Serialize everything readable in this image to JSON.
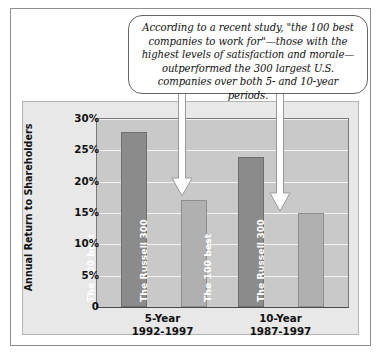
{
  "callout": {
    "text": "According to a recent study, \"the 100 best companies to work for\"—those with the highest levels of satisfaction and morale—outperformed the 300 largest U.S. companies over both 5- and 10-year periods."
  },
  "chart_data": {
    "type": "bar",
    "title": "",
    "xlabel": "",
    "ylabel": "Annual Return to Shareholders",
    "ylim": [
      0,
      30
    ],
    "ytick_labels": [
      "30%",
      "25%",
      "20%",
      "15%",
      "10%",
      "5%",
      "0"
    ],
    "ytick_values": [
      30,
      25,
      20,
      15,
      10,
      5,
      0
    ],
    "grid": true,
    "legend_position": "none",
    "categories": [
      "5-Year 1992-1997",
      "10-Year 1987-1997"
    ],
    "category_labels": [
      {
        "line1": "5-Year",
        "line2": "1992-1997"
      },
      {
        "line1": "10-Year",
        "line2": "1987-1997"
      }
    ],
    "series": [
      {
        "name": "The 100 best",
        "values": [
          28,
          24
        ],
        "color": "#8b8b8b"
      },
      {
        "name": "The Russell 300",
        "values": [
          17,
          15
        ],
        "color": "#b0b0b0"
      }
    ],
    "bars": [
      {
        "group": "5-Year 1992-1997",
        "label": "The 100 best",
        "value": 28,
        "style": "dark"
      },
      {
        "group": "5-Year 1992-1997",
        "label": "The Russell 300",
        "value": 17,
        "style": "light"
      },
      {
        "group": "10-Year 1987-1997",
        "label": "The 100 best",
        "value": 24,
        "style": "dark"
      },
      {
        "group": "10-Year 1987-1997",
        "label": "The Russell 300",
        "value": 15,
        "style": "light"
      }
    ],
    "annotations": [
      {
        "name": "arrow-to-russell-5year",
        "target": "The Russell 300 (5-Year)"
      },
      {
        "name": "arrow-to-russell-10year",
        "target": "The Russell 300 (10-Year)"
      }
    ]
  },
  "colors": {
    "panel_background": "#e8e8e8",
    "plot_background": "#c9c9c9",
    "gridline": "#f2f2f2",
    "bar_dark": "#8b8b8b",
    "bar_light": "#b0b0b0",
    "frame": "#8e8e8e",
    "text": "#111111"
  }
}
